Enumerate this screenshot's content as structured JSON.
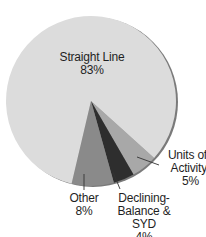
{
  "chart_data": {
    "type": "pie",
    "title": "",
    "categories": [
      "Straight Line",
      "Units of Activity",
      "Declining-Balance & SYD",
      "Other"
    ],
    "values": [
      83,
      5,
      4,
      8
    ],
    "unit": "%",
    "labels": [
      {
        "name": "Straight Line",
        "line1": "Straight Line",
        "line2": "83%"
      },
      {
        "name": "Units of Activity",
        "line1": "Units of",
        "line2": "Activity",
        "line3": "5%"
      },
      {
        "name": "Declining-Balance & SYD",
        "line1": "Declining-",
        "line2": "Balance & SYD",
        "line3": "4%"
      },
      {
        "name": "Other",
        "line1": "Other",
        "line2": "8%"
      }
    ],
    "colors": {
      "Straight Line": "#dcdcdc",
      "Units of Activity": "#a8a8a8",
      "Declining-Balance & SYD": "#2e2e2e",
      "Other": "#8a8a8a",
      "rim": "#7a7a7a"
    },
    "start_angle_deg": 132,
    "legend": "none (direct labels)"
  }
}
